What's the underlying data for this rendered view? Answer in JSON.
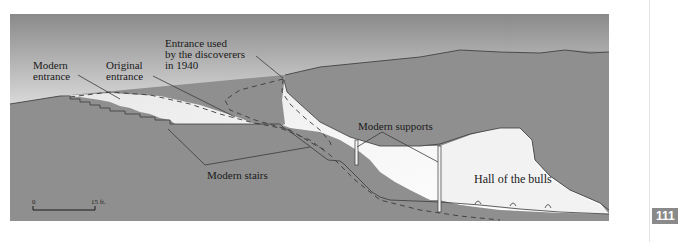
{
  "diagram": {
    "labels": {
      "modern_entrance": [
        "Modern",
        "entrance"
      ],
      "original_entrance": [
        "Original",
        "entrance"
      ],
      "discoverers_entrance": [
        "Entrance used",
        "by  the discoverers",
        "in 1940"
      ],
      "modern_supports": "Modern supports",
      "modern_stairs": "Modern stairs",
      "hall_of_bulls": "Hall of the bulls"
    },
    "scale_bar": {
      "start": "0",
      "end": "15 ft."
    },
    "colors": {
      "sky_top": "#8c8c8c",
      "sky_bottom": "#d8d8d8",
      "rock": "#8f8f8f",
      "cave_light": "#ededed",
      "cave_white": "#ffffff",
      "lines": "#3a3a3a"
    }
  },
  "page": {
    "number": "111"
  }
}
